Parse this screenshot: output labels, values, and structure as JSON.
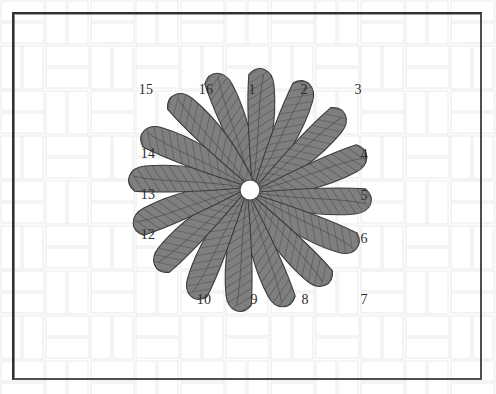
{
  "figure": {
    "kind": "radial-petal-diagram",
    "title": "",
    "background_pattern": "basket-weave",
    "frame_color": "#3a3a3a",
    "canvas": {
      "width": 496,
      "height": 394
    }
  },
  "flower": {
    "center": {
      "x": 250,
      "y": 190
    },
    "hub": {
      "radius": 10,
      "fill": "#ffffff",
      "stroke": "#4a4a4a"
    },
    "petal_count": 16,
    "petal_fill": "#7f7f7f",
    "petal_stroke": "#3c3c3c",
    "hatch_color": "#4a4a4a",
    "petal_length": 118,
    "petal_half_width": 17,
    "sweep_degrees": 26,
    "start_angle_degrees": -90,
    "step_degrees": 22.5
  },
  "labels": [
    {
      "text": "1",
      "x": 252,
      "y": 90
    },
    {
      "text": "2",
      "x": 304,
      "y": 90
    },
    {
      "text": "3",
      "x": 358,
      "y": 90
    },
    {
      "text": "4",
      "x": 364,
      "y": 155
    },
    {
      "text": "5",
      "x": 364,
      "y": 196
    },
    {
      "text": "6",
      "x": 364,
      "y": 239
    },
    {
      "text": "7",
      "x": 364,
      "y": 300
    },
    {
      "text": "8",
      "x": 305,
      "y": 300
    },
    {
      "text": "9",
      "x": 254,
      "y": 300
    },
    {
      "text": "10",
      "x": 204,
      "y": 300
    },
    {
      "text": "11",
      "x": 146,
      "y": 300
    },
    {
      "text": "12",
      "x": 148,
      "y": 235
    },
    {
      "text": "13",
      "x": 148,
      "y": 195
    },
    {
      "text": "14",
      "x": 148,
      "y": 154
    },
    {
      "text": "15",
      "x": 146,
      "y": 90
    },
    {
      "text": "16",
      "x": 206,
      "y": 90
    }
  ],
  "visible_labels": [
    "15",
    "16",
    "1",
    "2",
    "3",
    "14",
    "4",
    "13",
    "5",
    "12",
    "6",
    "10",
    "9",
    "8",
    "7"
  ]
}
